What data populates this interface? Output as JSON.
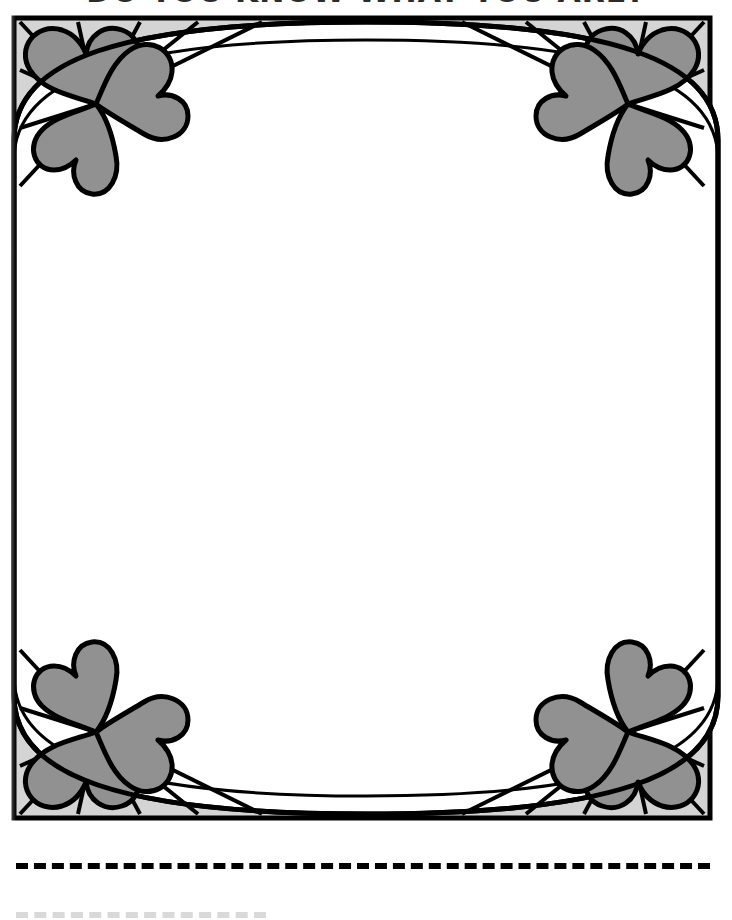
{
  "page": {
    "width": 732,
    "height": 920,
    "background_color": "#ffffff"
  },
  "heading": {
    "text": "DO YOU KNOW WHAT YOU ARE?",
    "note": "clipped at top edge of image",
    "color": "#2b2b2b"
  },
  "frame": {
    "name": "ornamental-heart-border",
    "outline_color": "#000000",
    "panel_fill": "#d4d4d4",
    "heart_fill": "#919191",
    "inner_fill": "#ffffff",
    "left": 14,
    "top": 18,
    "right": 710,
    "bottom": 818,
    "stroke_width": 5,
    "corners": [
      {
        "name": "corner-top-left",
        "hearts": 3,
        "rays": 7
      },
      {
        "name": "corner-top-right",
        "hearts": 3,
        "rays": 7
      },
      {
        "name": "corner-bottom-left",
        "hearts": 3,
        "rays": 7
      },
      {
        "name": "corner-bottom-right",
        "hearts": 3,
        "rays": 7
      }
    ]
  },
  "writing_area": {
    "name": "blank-writing-oval",
    "fill": "#ffffff",
    "content": ""
  },
  "rules": [
    {
      "name": "dashed-rule-1",
      "style": "dashed",
      "color": "#000000",
      "x": 16,
      "y": 863,
      "width": 694,
      "thickness": 6
    },
    {
      "name": "dashed-rule-2",
      "style": "dashed",
      "color": "#d9d9d9",
      "x": 16,
      "y": 912,
      "width": 250,
      "thickness": 6,
      "note": "clipped at bottom edge"
    }
  ]
}
